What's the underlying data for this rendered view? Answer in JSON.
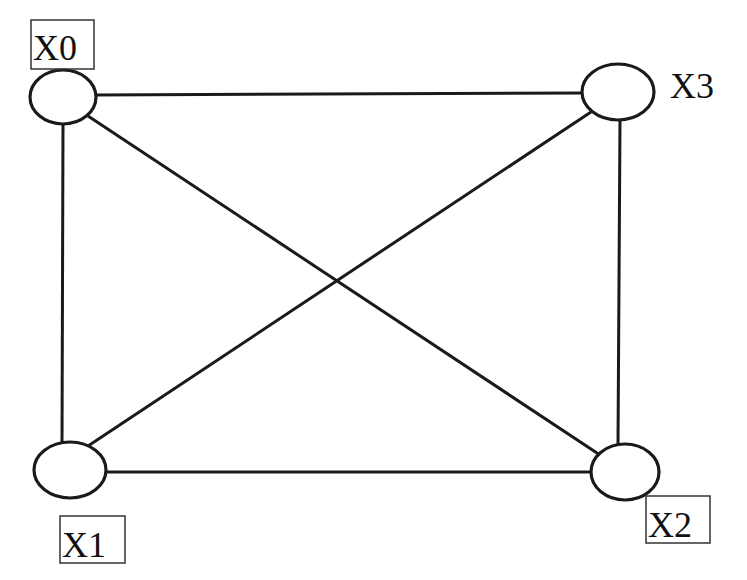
{
  "diagram": {
    "type": "complete-graph",
    "nodes": [
      {
        "id": "X0",
        "label": "X0",
        "boxed": true
      },
      {
        "id": "X1",
        "label": "X1",
        "boxed": true
      },
      {
        "id": "X2",
        "label": "X2",
        "boxed": true
      },
      {
        "id": "X3",
        "label": "X3",
        "boxed": false
      }
    ],
    "edges": [
      [
        "X0",
        "X3"
      ],
      [
        "X0",
        "X1"
      ],
      [
        "X0",
        "X2"
      ],
      [
        "X3",
        "X1"
      ],
      [
        "X3",
        "X2"
      ],
      [
        "X1",
        "X2"
      ]
    ],
    "colors": {
      "stroke": "#1a1a1a",
      "background": "#ffffff"
    }
  }
}
